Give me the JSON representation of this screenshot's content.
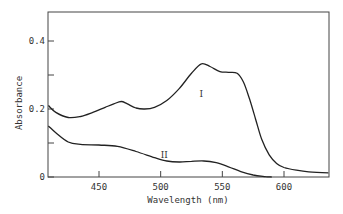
{
  "chart_data": {
    "type": "line",
    "title": "",
    "xlabel": "Wavelength (nm)",
    "ylabel": "Absorbance",
    "xlim": [
      409,
      636
    ],
    "ylim": [
      0,
      0.48
    ],
    "grid": false,
    "legend": "inline curve labels",
    "x_ticks": [
      450,
      500,
      550,
      600
    ],
    "x_tick_labels": [
      "450",
      "500",
      "550",
      "600"
    ],
    "y_ticks": [
      0,
      0.1,
      0.2,
      0.3,
      0.4
    ],
    "y_tick_labels": [
      "0",
      "",
      "0.2",
      "",
      "0.4"
    ],
    "series": [
      {
        "name": "I",
        "label_at": [
          533,
          0.235
        ],
        "points": [
          [
            409,
            0.21
          ],
          [
            415,
            0.19
          ],
          [
            425,
            0.175
          ],
          [
            435,
            0.178
          ],
          [
            445,
            0.19
          ],
          [
            455,
            0.205
          ],
          [
            462,
            0.215
          ],
          [
            468,
            0.222
          ],
          [
            473,
            0.215
          ],
          [
            480,
            0.203
          ],
          [
            487,
            0.2
          ],
          [
            495,
            0.205
          ],
          [
            505,
            0.225
          ],
          [
            515,
            0.26
          ],
          [
            525,
            0.305
          ],
          [
            533,
            0.333
          ],
          [
            540,
            0.325
          ],
          [
            548,
            0.31
          ],
          [
            555,
            0.308
          ],
          [
            562,
            0.305
          ],
          [
            567,
            0.28
          ],
          [
            572,
            0.23
          ],
          [
            577,
            0.17
          ],
          [
            582,
            0.11
          ],
          [
            588,
            0.065
          ],
          [
            594,
            0.04
          ],
          [
            600,
            0.028
          ],
          [
            610,
            0.02
          ],
          [
            620,
            0.015
          ],
          [
            636,
            0.012
          ]
        ]
      },
      {
        "name": "II",
        "label_at": [
          503,
          0.055
        ],
        "points": [
          [
            409,
            0.15
          ],
          [
            415,
            0.13
          ],
          [
            425,
            0.103
          ],
          [
            435,
            0.096
          ],
          [
            450,
            0.094
          ],
          [
            465,
            0.09
          ],
          [
            480,
            0.075
          ],
          [
            495,
            0.057
          ],
          [
            505,
            0.047
          ],
          [
            515,
            0.044
          ],
          [
            525,
            0.046
          ],
          [
            535,
            0.047
          ],
          [
            545,
            0.042
          ],
          [
            555,
            0.03
          ],
          [
            565,
            0.016
          ],
          [
            575,
            0.006
          ],
          [
            585,
            0.001
          ],
          [
            590,
            0.0
          ]
        ]
      }
    ]
  }
}
